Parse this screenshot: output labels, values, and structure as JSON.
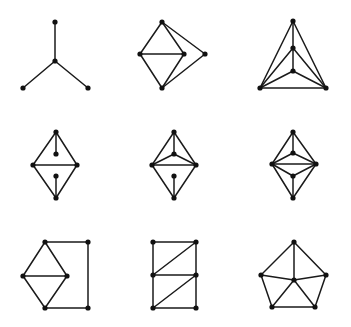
{
  "figure": {
    "width": 351,
    "height": 327,
    "background": "#ffffff",
    "edge_color": "#1a1a1a",
    "node_color": "#111111",
    "node_radius": 2.6,
    "edge_width": 1.5
  },
  "graphs": [
    {
      "id": "g1",
      "nodes": [
        [
          55,
          22
        ],
        [
          55,
          61
        ],
        [
          23,
          88
        ],
        [
          88,
          88
        ]
      ],
      "edges": [
        [
          0,
          1
        ],
        [
          1,
          2
        ],
        [
          1,
          3
        ]
      ]
    },
    {
      "id": "g2",
      "nodes": [
        [
          162,
          22
        ],
        [
          140,
          54
        ],
        [
          184,
          54
        ],
        [
          205,
          54
        ],
        [
          162,
          88
        ]
      ],
      "edges": [
        [
          0,
          1
        ],
        [
          0,
          2
        ],
        [
          0,
          3
        ],
        [
          1,
          2
        ],
        [
          1,
          4
        ],
        [
          2,
          4
        ],
        [
          3,
          4
        ]
      ]
    },
    {
      "id": "g3",
      "nodes": [
        [
          293,
          21
        ],
        [
          293,
          48
        ],
        [
          293,
          71
        ],
        [
          260,
          88
        ],
        [
          326,
          88
        ]
      ],
      "edges": [
        [
          0,
          1
        ],
        [
          1,
          2
        ],
        [
          0,
          3
        ],
        [
          0,
          4
        ],
        [
          3,
          4
        ],
        [
          1,
          3
        ],
        [
          1,
          4
        ],
        [
          2,
          3
        ],
        [
          2,
          4
        ]
      ]
    },
    {
      "id": "g4",
      "nodes": [
        [
          56,
          132
        ],
        [
          56,
          154
        ],
        [
          33,
          165
        ],
        [
          77,
          165
        ],
        [
          56,
          176
        ],
        [
          56,
          198
        ]
      ],
      "edges": [
        [
          0,
          1
        ],
        [
          0,
          2
        ],
        [
          0,
          3
        ],
        [
          2,
          3
        ],
        [
          2,
          5
        ],
        [
          3,
          5
        ],
        [
          4,
          5
        ]
      ]
    },
    {
      "id": "g5",
      "nodes": [
        [
          174,
          132
        ],
        [
          174,
          154
        ],
        [
          152,
          165
        ],
        [
          196,
          165
        ],
        [
          174,
          176
        ],
        [
          174,
          198
        ]
      ],
      "edges": [
        [
          0,
          1
        ],
        [
          0,
          2
        ],
        [
          0,
          3
        ],
        [
          1,
          2
        ],
        [
          1,
          3
        ],
        [
          2,
          3
        ],
        [
          2,
          5
        ],
        [
          3,
          5
        ],
        [
          4,
          5
        ]
      ]
    },
    {
      "id": "g6",
      "nodes": [
        [
          293,
          132
        ],
        [
          293,
          153
        ],
        [
          272,
          164
        ],
        [
          316,
          164
        ],
        [
          293,
          176
        ],
        [
          293,
          198
        ]
      ],
      "edges": [
        [
          0,
          1
        ],
        [
          0,
          2
        ],
        [
          0,
          3
        ],
        [
          1,
          2
        ],
        [
          1,
          3
        ],
        [
          2,
          3
        ],
        [
          2,
          4
        ],
        [
          3,
          4
        ],
        [
          4,
          5
        ],
        [
          2,
          5
        ],
        [
          3,
          5
        ]
      ]
    },
    {
      "id": "g7",
      "nodes": [
        [
          45,
          242
        ],
        [
          23,
          276
        ],
        [
          67,
          276
        ],
        [
          45,
          308
        ],
        [
          88,
          242
        ],
        [
          88,
          308
        ]
      ],
      "edges": [
        [
          0,
          1
        ],
        [
          0,
          2
        ],
        [
          1,
          2
        ],
        [
          1,
          3
        ],
        [
          2,
          3
        ],
        [
          0,
          4
        ],
        [
          4,
          5
        ],
        [
          3,
          5
        ]
      ]
    },
    {
      "id": "g8",
      "nodes": [
        [
          153,
          242
        ],
        [
          196,
          242
        ],
        [
          153,
          275
        ],
        [
          196,
          275
        ],
        [
          153,
          308
        ],
        [
          196,
          308
        ]
      ],
      "edges": [
        [
          0,
          1
        ],
        [
          0,
          2
        ],
        [
          1,
          3
        ],
        [
          2,
          1
        ],
        [
          2,
          3
        ],
        [
          2,
          4
        ],
        [
          3,
          5
        ],
        [
          4,
          3
        ],
        [
          4,
          5
        ]
      ]
    },
    {
      "id": "g9",
      "nodes": [
        [
          294,
          242
        ],
        [
          261,
          275
        ],
        [
          326,
          275
        ],
        [
          294,
          280
        ],
        [
          272,
          307
        ],
        [
          315,
          307
        ]
      ],
      "edges": [
        [
          0,
          1
        ],
        [
          0,
          2
        ],
        [
          0,
          3
        ],
        [
          1,
          3
        ],
        [
          2,
          3
        ],
        [
          1,
          4
        ],
        [
          2,
          5
        ],
        [
          3,
          4
        ],
        [
          3,
          5
        ],
        [
          4,
          5
        ]
      ]
    }
  ]
}
